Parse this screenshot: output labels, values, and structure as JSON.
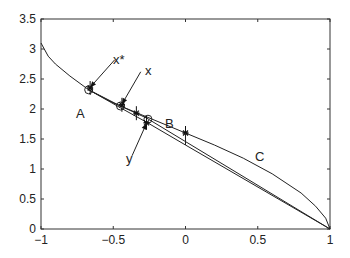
{
  "chart_data": {
    "type": "line",
    "title": "",
    "xlabel": "",
    "ylabel": "",
    "xlim": [
      -1,
      1
    ],
    "ylim": [
      0,
      3.5
    ],
    "grid": false,
    "x_ticks": [
      "-1",
      "-0.5",
      "0",
      "0.5",
      "1"
    ],
    "y_ticks": [
      "0",
      "0.5",
      "1",
      "1.5",
      "2",
      "2.5",
      "3",
      "3.5"
    ],
    "series": [
      {
        "name": "upper curve (A-C)",
        "x": [
          -1,
          -0.95,
          -0.9,
          -0.8,
          -0.67,
          -0.5,
          -0.3,
          -0.1,
          0,
          0.2,
          0.4,
          0.6,
          0.8,
          0.9,
          0.97,
          1
        ],
        "y": [
          3.1,
          2.88,
          2.75,
          2.55,
          2.32,
          2.1,
          1.9,
          1.7,
          1.6,
          1.4,
          1.18,
          0.92,
          0.6,
          0.38,
          0.18,
          0
        ]
      },
      {
        "name": "lower line",
        "x": [
          -0.67,
          -0.45,
          -0.27,
          0,
          1
        ],
        "y": [
          2.32,
          2.02,
          1.78,
          1.4,
          0
        ]
      },
      {
        "name": "middle line",
        "x": [
          -0.67,
          -0.45,
          -0.27,
          1
        ],
        "y": [
          2.32,
          2.05,
          1.85,
          0
        ]
      }
    ],
    "markers": [
      {
        "type": "circle",
        "x": -0.67,
        "y": 2.32,
        "label": "A"
      },
      {
        "type": "circle",
        "x": -0.45,
        "y": 2.05
      },
      {
        "type": "circle",
        "x": -0.26,
        "y": 1.83,
        "label": "B"
      },
      {
        "type": "star",
        "x": -0.66,
        "y": 2.35
      },
      {
        "type": "star",
        "x": -0.44,
        "y": 2.07
      },
      {
        "type": "star",
        "x": -0.34,
        "y": 1.93
      },
      {
        "type": "star",
        "x": -0.27,
        "y": 1.77
      },
      {
        "type": "star",
        "x": 0,
        "y": 1.6
      }
    ],
    "annotations": [
      {
        "text": "x*",
        "x": -0.48,
        "y": 2.85,
        "arrow_to": [
          -0.66,
          2.35
        ]
      },
      {
        "text": "x",
        "x": -0.3,
        "y": 2.65,
        "arrow_to": [
          -0.44,
          2.07
        ]
      },
      {
        "text": "y",
        "x": -0.38,
        "y": 1.15,
        "arrow_to": [
          -0.27,
          1.77
        ]
      },
      {
        "text": "A",
        "x": -0.78,
        "y": 1.95
      },
      {
        "text": "B",
        "x": -0.16,
        "y": 1.8
      },
      {
        "text": "C",
        "x": 0.6,
        "y": 1.22
      }
    ]
  },
  "axis": {
    "x_ticks": [
      "-1",
      "-0.5",
      "0",
      "0.5",
      "1"
    ],
    "y_ticks": [
      "0",
      "0.5",
      "1",
      "1.5",
      "2",
      "2.5",
      "3",
      "3.5"
    ]
  },
  "labels": {
    "A": "A",
    "B": "B",
    "C": "C",
    "xstar": "x*",
    "x": "x",
    "y": "y"
  }
}
